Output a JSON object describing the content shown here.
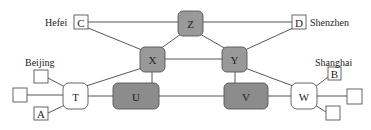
{
  "colors": {
    "router_fill": "#999999",
    "core_fill": "#8c8c8c",
    "switch_fill": "#ffffff",
    "host_fill": "#ffffff",
    "stroke": "#555555",
    "edge": "#444444"
  },
  "nodes": [
    {
      "id": "Z",
      "label": "Z",
      "type": "router",
      "x": 178,
      "y": 11,
      "w": 25,
      "h": 25
    },
    {
      "id": "X",
      "label": "X",
      "type": "router",
      "x": 140,
      "y": 47,
      "w": 25,
      "h": 25
    },
    {
      "id": "Y",
      "label": "Y",
      "type": "router",
      "x": 222,
      "y": 47,
      "w": 25,
      "h": 25
    },
    {
      "id": "U",
      "label": "U",
      "type": "core",
      "x": 113,
      "y": 83,
      "w": 46,
      "h": 26
    },
    {
      "id": "V",
      "label": "V",
      "type": "core",
      "x": 224,
      "y": 83,
      "w": 44,
      "h": 26
    },
    {
      "id": "T",
      "label": "T",
      "type": "switch",
      "x": 63,
      "y": 83,
      "w": 25,
      "h": 26
    },
    {
      "id": "W",
      "label": "W",
      "type": "switch",
      "x": 291,
      "y": 83,
      "w": 26,
      "h": 26
    },
    {
      "id": "C",
      "label": "C",
      "type": "host",
      "x": 74,
      "y": 15,
      "w": 14,
      "h": 14
    },
    {
      "id": "D",
      "label": "D",
      "type": "host",
      "x": 292,
      "y": 15,
      "w": 14,
      "h": 14
    },
    {
      "id": "A",
      "label": "A",
      "type": "host",
      "x": 34,
      "y": 107,
      "w": 14,
      "h": 13
    },
    {
      "id": "B",
      "label": "B",
      "type": "host",
      "x": 328,
      "y": 67,
      "w": 13,
      "h": 13
    },
    {
      "id": "L1",
      "label": "",
      "type": "host",
      "x": 34,
      "y": 70,
      "w": 14,
      "h": 13
    },
    {
      "id": "L2",
      "label": "",
      "type": "host",
      "x": 13,
      "y": 88,
      "w": 14,
      "h": 14
    },
    {
      "id": "R1",
      "label": "",
      "type": "host",
      "x": 347,
      "y": 89,
      "w": 15,
      "h": 15
    },
    {
      "id": "R2",
      "label": "",
      "type": "host",
      "x": 326,
      "y": 106,
      "w": 14,
      "h": 14
    }
  ],
  "edges": [
    {
      "from": "C",
      "to": "Z",
      "x1": 88,
      "y1": 22,
      "x2": 178,
      "y2": 22
    },
    {
      "from": "Z",
      "to": "D",
      "x1": 203,
      "y1": 22,
      "x2": 292,
      "y2": 22
    },
    {
      "from": "C",
      "to": "X",
      "x1": 88,
      "y1": 28,
      "x2": 142,
      "y2": 50
    },
    {
      "from": "Z",
      "to": "X",
      "x1": 181,
      "y1": 34,
      "x2": 160,
      "y2": 49
    },
    {
      "from": "Z",
      "to": "Y",
      "x1": 200,
      "y1": 34,
      "x2": 226,
      "y2": 49
    },
    {
      "from": "D",
      "to": "Y",
      "x1": 293,
      "y1": 28,
      "x2": 245,
      "y2": 50
    },
    {
      "from": "X",
      "to": "Y",
      "x1": 165,
      "y1": 59,
      "x2": 222,
      "y2": 59
    },
    {
      "from": "X",
      "to": "T",
      "x1": 142,
      "y1": 68,
      "x2": 86,
      "y2": 86
    },
    {
      "from": "Y",
      "to": "W",
      "x1": 245,
      "y1": 68,
      "x2": 293,
      "y2": 86
    },
    {
      "from": "X",
      "to": "U",
      "x1": 152,
      "y1": 72,
      "x2": 152,
      "y2": 83
    },
    {
      "from": "Y",
      "to": "V",
      "x1": 235,
      "y1": 72,
      "x2": 235,
      "y2": 83
    },
    {
      "from": "T",
      "to": "U",
      "x1": 88,
      "y1": 96,
      "x2": 113,
      "y2": 96
    },
    {
      "from": "U",
      "to": "V",
      "x1": 159,
      "y1": 96,
      "x2": 224,
      "y2": 96
    },
    {
      "from": "V",
      "to": "W",
      "x1": 268,
      "y1": 96,
      "x2": 291,
      "y2": 96
    },
    {
      "from": "L1",
      "to": "T",
      "x1": 48,
      "y1": 78,
      "x2": 65,
      "y2": 87
    },
    {
      "from": "L2",
      "to": "T",
      "x1": 27,
      "y1": 95,
      "x2": 63,
      "y2": 95
    },
    {
      "from": "A",
      "to": "T",
      "x1": 48,
      "y1": 113,
      "x2": 65,
      "y2": 105
    },
    {
      "from": "W",
      "to": "B",
      "x1": 315,
      "y1": 87,
      "x2": 328,
      "y2": 77
    },
    {
      "from": "W",
      "to": "R1",
      "x1": 317,
      "y1": 96,
      "x2": 347,
      "y2": 96
    },
    {
      "from": "W",
      "to": "R2",
      "x1": 315,
      "y1": 105,
      "x2": 326,
      "y2": 112
    }
  ],
  "labels": [
    {
      "id": "hefei",
      "text": "Hefei",
      "x": 45,
      "y": 22
    },
    {
      "id": "shenzhen",
      "text": "Shenzhen",
      "x": 310,
      "y": 22
    },
    {
      "id": "beijing",
      "text": "Beijing",
      "x": 25,
      "y": 62
    },
    {
      "id": "shanghai",
      "text": "Shanghai",
      "x": 315,
      "y": 62
    }
  ]
}
